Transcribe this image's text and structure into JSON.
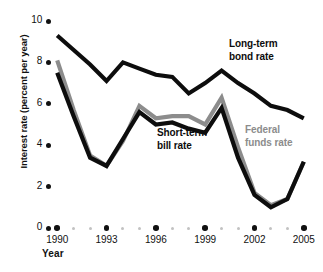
{
  "chart_data": {
    "type": "line",
    "title": "",
    "xlabel": "Year",
    "ylabel": "Interest rate (percent per year)",
    "xlim": [
      1989.5,
      2005.5
    ],
    "ylim": [
      0,
      10
    ],
    "grid": false,
    "legend_position": "inline-annotations",
    "x": [
      1990,
      1991,
      1992,
      1993,
      1994,
      1995,
      1996,
      1997,
      1998,
      1999,
      2000,
      2001,
      2002,
      2003,
      2004,
      2005
    ],
    "xtick_labels": [
      "1990",
      "1993",
      "1996",
      "1999",
      "2002",
      "2005"
    ],
    "xtick_values": [
      1990,
      1993,
      1996,
      1999,
      2002,
      2005
    ],
    "ytick_labels": [
      "10",
      "8",
      "6",
      "4",
      "2",
      "0"
    ],
    "ytick_values": [
      10,
      8,
      6,
      4,
      2,
      0
    ],
    "series": [
      {
        "name": "Long-term bond rate",
        "color": "#0d0d0d",
        "values": [
          9.3,
          8.6,
          7.9,
          7.1,
          8.0,
          7.7,
          7.4,
          7.3,
          6.5,
          7.0,
          7.6,
          7.0,
          6.5,
          5.9,
          5.7,
          5.3
        ]
      },
      {
        "name": "Federal funds rate",
        "color": "#8c8c8c",
        "values": [
          8.1,
          5.7,
          3.5,
          3.0,
          4.2,
          5.9,
          5.3,
          5.4,
          5.4,
          5.0,
          6.3,
          3.9,
          1.7,
          1.1,
          1.4,
          3.2
        ]
      },
      {
        "name": "Short-term bill rate",
        "color": "#0d0d0d",
        "values": [
          7.5,
          5.4,
          3.4,
          3.0,
          4.3,
          5.6,
          5.0,
          5.1,
          4.8,
          4.6,
          5.8,
          3.4,
          1.6,
          1.0,
          1.4,
          3.2
        ]
      }
    ],
    "annotations": [
      {
        "text_line1": "Long-term",
        "text_line2": "bond rate",
        "color": "#0d0d0d"
      },
      {
        "text_line1": "Short-term",
        "text_line2": "bill rate",
        "color": "#0d0d0d"
      },
      {
        "text_line1": "Federal",
        "text_line2": "funds rate",
        "color": "#8c8c8c"
      }
    ]
  }
}
